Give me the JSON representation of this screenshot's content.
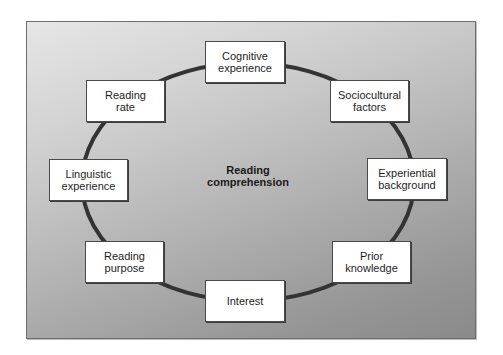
{
  "diagram": {
    "center": {
      "line1": "Reading",
      "line2": "comprehension"
    },
    "nodes": [
      {
        "id": "cognitive-experience",
        "line1": "Cognitive",
        "line2": "experience"
      },
      {
        "id": "sociocultural-factors",
        "line1": "Sociocultural",
        "line2": "factors"
      },
      {
        "id": "experiential-background",
        "line1": "Experiential",
        "line2": "background"
      },
      {
        "id": "prior-knowledge",
        "line1": "Prior",
        "line2": "knowledge"
      },
      {
        "id": "interest",
        "line1": "Interest",
        "line2": ""
      },
      {
        "id": "reading-purpose",
        "line1": "Reading",
        "line2": "purpose"
      },
      {
        "id": "linguistic-experience",
        "line1": "Linguistic",
        "line2": "experience"
      },
      {
        "id": "reading-rate",
        "line1": "Reading",
        "line2": "rate"
      }
    ],
    "colors": {
      "ring": "#333333",
      "box_border": "#4a4a4a",
      "box_fill": "#ffffff",
      "background_light": "#e6e6e6",
      "background_dark": "#8a8a8a"
    }
  }
}
